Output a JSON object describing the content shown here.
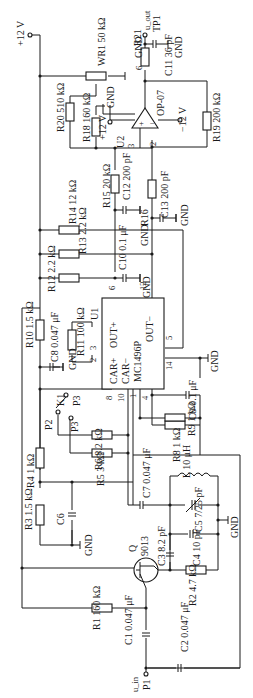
{
  "diagram": {
    "orientation": "rotated-90-clockwise",
    "supply": {
      "pos": "+12 V",
      "neg": "−12 V"
    },
    "ics": [
      {
        "ref": "U1",
        "part": "MC1496P",
        "pins": [
          "CAR+",
          "OUT+",
          "CAR−",
          "OUT−"
        ],
        "pin_numbers": [
          "1",
          "2",
          "3",
          "4",
          "5",
          "6",
          "8",
          "10",
          "12",
          "14"
        ]
      },
      {
        "ref": "U2",
        "part": "OP-07",
        "pin_numbers": [
          "2",
          "3",
          "4",
          "6",
          "7",
          "8"
        ]
      }
    ],
    "transistor": {
      "ref": "Q",
      "part": "9013"
    },
    "switch": {
      "ref": "K1",
      "positions": [
        "P2",
        "P3"
      ],
      "common": "P"
    },
    "terminals": {
      "input": "u_in P1",
      "output": "u_out TP1",
      "gnd": "GND"
    },
    "resistors": [
      {
        "ref": "R1",
        "value": "160 kΩ"
      },
      {
        "ref": "R2",
        "value": "4.7 kΩ"
      },
      {
        "ref": "R3",
        "value": "1.5 kΩ"
      },
      {
        "ref": "R4",
        "value": "1 kΩ"
      },
      {
        "ref": "R5",
        "value": "3 kΩ"
      },
      {
        "ref": "R6",
        "value": "8.2 kΩ"
      },
      {
        "ref": "R8",
        "value": "1 kΩ"
      },
      {
        "ref": "R9",
        "value": "1 kΩ"
      },
      {
        "ref": "R10",
        "value": "1.5 kΩ"
      },
      {
        "ref": "R11",
        "value": "100 kΩ"
      },
      {
        "ref": "R12",
        "value": "2.2 kΩ"
      },
      {
        "ref": "R13",
        "value": "2.2 kΩ"
      },
      {
        "ref": "R14",
        "value": "12 kΩ"
      },
      {
        "ref": "R15",
        "value": "20 kΩ"
      },
      {
        "ref": "R16",
        "value": ""
      },
      {
        "ref": "R18",
        "value": "160 kΩ"
      },
      {
        "ref": "R19",
        "value": "200 kΩ"
      },
      {
        "ref": "R20",
        "value": "510 kΩ"
      },
      {
        "ref": "R21",
        "value": ""
      },
      {
        "ref": "WR1",
        "value": "50 kΩ"
      }
    ],
    "capacitors": [
      {
        "ref": "C1",
        "value": "0.047 μF"
      },
      {
        "ref": "C2",
        "value": "0.047 μF"
      },
      {
        "ref": "C3",
        "value": "8.2 pF"
      },
      {
        "ref": "C4",
        "value": "10 pF"
      },
      {
        "ref": "C5",
        "value": "7/25 pF"
      },
      {
        "ref": "C6",
        "value": ""
      },
      {
        "ref": "C7",
        "value": "0.047 μF"
      },
      {
        "ref": "C8",
        "value": "0.047 μF"
      },
      {
        "ref": "C9",
        "value": "0.1 μF"
      },
      {
        "ref": "C10",
        "value": "0.1 μF"
      },
      {
        "ref": "C11",
        "value": "36 pF"
      },
      {
        "ref": "C12",
        "value": "200 pF"
      },
      {
        "ref": "C13",
        "value": "200 pF"
      }
    ],
    "inductors": [
      {
        "ref": "L",
        "value": "10 μH"
      }
    ],
    "labels": {
      "vpos": "+12 V",
      "vneg": "−12 V",
      "gnd": "GND",
      "u1_ref": "U1",
      "u1_part": "MC1496P",
      "u1_carp": "CAR+",
      "u1_outp": "OUT+",
      "u1_carm": "CAR−",
      "u1_outm": "OUT−",
      "u2_ref": "U2",
      "u2_part": "OP-07",
      "q_ref": "Q",
      "q_part": "9013",
      "k_ref": "K1",
      "p_in": "P1",
      "p2": "P2",
      "p3": "P3",
      "u_in": "u_in",
      "u_out": "u_out",
      "tp1": "TP1",
      "R1": "R1 160 kΩ",
      "R2": "R2 4.7 kΩ",
      "R3": "R3 1.5 kΩ",
      "R4": "R4 1 kΩ",
      "R5": "R5 3 kΩ",
      "R6": "R6 8.2 kΩ",
      "R8": "R8 1 kΩ",
      "R9": "R9 1 kΩ",
      "R10": "R10 1.5 kΩ",
      "R11": "R11 100 kΩ",
      "R12": "R12 2.2 kΩ",
      "R13": "R13 2.2 kΩ",
      "R14": "R14 12 kΩ",
      "R15": "R15 20 kΩ",
      "R16": "R16",
      "R18": "R18 160 kΩ",
      "R19": "R19 200 kΩ",
      "R20": "R20 510 kΩ",
      "R21": "R21",
      "WR1": "WR1 50 kΩ",
      "C1": "C1 0.047 μF",
      "C2": "C2 0.047 μF",
      "C3": "C3 8.2 pF",
      "C4": "C4 10 pF",
      "C5": "C5 7/25 pF",
      "C6": "C6",
      "C7": "C7 0.047 μF",
      "C8": "C8 0.047 μF",
      "C9": "C9 0.1 μF",
      "C10": "C10 0.1 μF",
      "C11": "C11 36 pF",
      "C12": "C12 200 pF",
      "C13": "C13 200 pF",
      "L": "L 10 μH",
      "pin1": "1",
      "pin2": "2",
      "pin3": "3",
      "pin4": "4",
      "pin5": "5",
      "pin6": "6",
      "pin7": "7",
      "pin8": "8",
      "pin10": "10",
      "pin12": "12",
      "pin14": "14"
    }
  }
}
